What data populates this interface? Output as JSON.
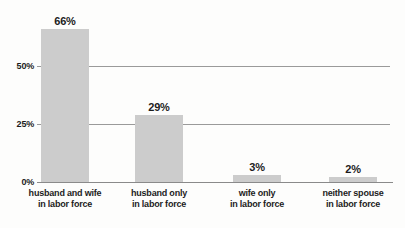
{
  "chart_data": {
    "type": "bar",
    "categories": [
      "husband and wife\nin labor force",
      "husband only\nin labor force",
      "wife only\nin labor force",
      "neither spouse\nin labor force"
    ],
    "values": [
      66,
      29,
      3,
      2
    ],
    "value_labels": [
      "66%",
      "29%",
      "3%",
      "2%"
    ],
    "yticks": [
      {
        "label": "50%",
        "value": 50
      },
      {
        "label": "25%",
        "value": 25
      },
      {
        "label": "0%",
        "value": 0
      }
    ],
    "ylim": [
      0,
      66
    ],
    "title": "",
    "xlabel": "",
    "ylabel": "",
    "grid": "horizontal gridlines at y ticks",
    "legend": "none",
    "bar_color": "#cccccc",
    "gridline_color": "#9a9a9a",
    "baseline_color": "#8a8a8a",
    "text_color": "#1c1c1c"
  }
}
